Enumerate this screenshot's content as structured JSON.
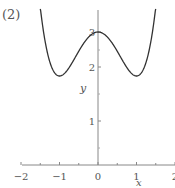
{
  "panel_label": "(2)",
  "chart_data": {
    "type": "line",
    "title": "",
    "function": "y = x^4 - 2x^2 + 3",
    "xlabel": "x",
    "ylabel": "y",
    "xlim": [
      -2,
      2
    ],
    "ylim": [
      0,
      3.6
    ],
    "x_ticks": [
      -2,
      -1,
      0,
      1,
      2
    ],
    "x_tick_labels": [
      "-2",
      "-1",
      "0",
      "1",
      "2"
    ],
    "y_ticks": [
      1,
      2,
      3
    ],
    "y_tick_labels": [
      "1",
      "2",
      "3"
    ],
    "grid": false,
    "legend": null,
    "series": [
      {
        "name": "f(x)",
        "x": [
          -1.5,
          -1.25,
          -1.0,
          -0.75,
          -0.5,
          -0.25,
          0,
          0.25,
          0.5,
          0.75,
          1.0,
          1.25,
          1.5
        ],
        "values": [
          3.5625,
          2.3164,
          2.0,
          2.1914,
          2.5625,
          2.8789,
          3.0,
          2.8789,
          2.5625,
          2.1914,
          2.0,
          2.3164,
          3.5625
        ]
      }
    ],
    "key_points": {
      "local_max": [
        0,
        3
      ],
      "local_min": [
        [
          -1,
          2
        ],
        [
          1,
          2
        ]
      ]
    }
  },
  "colors": {
    "curve": "#333333",
    "axis": "#888888",
    "text": "#555555"
  }
}
